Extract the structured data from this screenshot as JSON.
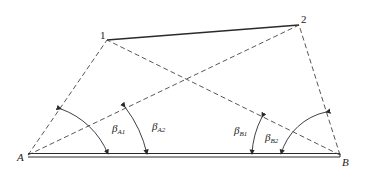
{
  "diagram": {
    "points": {
      "p1": {
        "label": "1",
        "x": 107,
        "y": 40
      },
      "p2": {
        "label": "2",
        "x": 299,
        "y": 25
      },
      "A": {
        "label": "A",
        "x": 28,
        "y": 155
      },
      "B": {
        "label": "B",
        "x": 340,
        "y": 155
      }
    },
    "angles": [
      {
        "symbol": "β",
        "sub": "A1",
        "vertex": "A"
      },
      {
        "symbol": "β",
        "sub": "A2",
        "vertex": "A"
      },
      {
        "symbol": "β",
        "sub": "B1",
        "vertex": "B"
      },
      {
        "symbol": "β",
        "sub": "B2",
        "vertex": "B"
      }
    ],
    "colors": {
      "line": "#2a2a2a",
      "background": "#ffffff"
    }
  }
}
